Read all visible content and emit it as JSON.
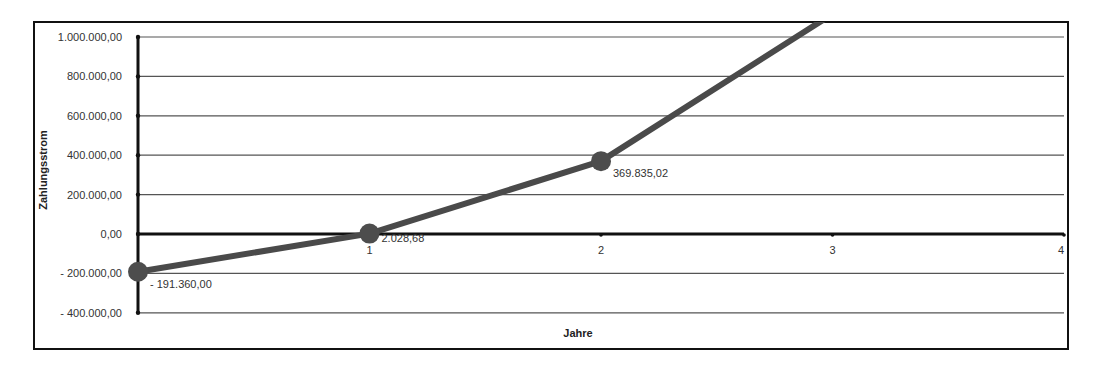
{
  "chart_data": {
    "type": "line",
    "title": "",
    "xlabel": "Jahre",
    "ylabel": "Zahlungsstrom",
    "x": [
      0,
      1,
      2,
      3
    ],
    "x_ticks": [
      "1",
      "2",
      "3",
      "4"
    ],
    "y_ticks": [
      "1.000.000,00",
      "800.000,00",
      "600.000,00",
      "400.000,00",
      "200.000,00",
      "0,00",
      "- 200.000,00",
      "- 400.000,00"
    ],
    "ylim": [
      -400000,
      1000000
    ],
    "xlim": [
      0,
      4
    ],
    "grid": true,
    "legend": "none",
    "series": [
      {
        "name": "Zahlungsstrom",
        "values": [
          -191360.0,
          2028.68,
          369835.02,
          1117000
        ],
        "data_labels": [
          "- 191.360,00",
          "2.028,68",
          "369.835,02",
          ""
        ]
      }
    ],
    "annotations": [
      "Last point exceeds y-axis maximum and is clipped at top"
    ]
  }
}
